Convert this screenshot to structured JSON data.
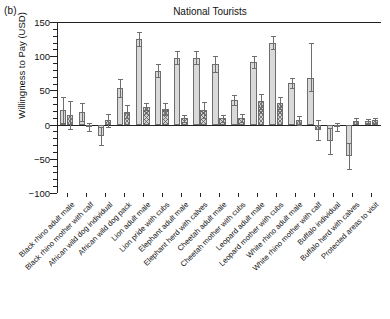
{
  "panel": {
    "label": "(b)"
  },
  "title": "National Tourists",
  "axes": {
    "ylabel": "Willingness to Pay (USD)",
    "ylim": [
      -100,
      150
    ],
    "yticks": [
      150,
      100,
      50,
      0,
      -50,
      -100
    ],
    "yticklabels": [
      "150",
      "100",
      "50",
      "0",
      "−50",
      "−100"
    ],
    "grid": false
  },
  "chart_data": {
    "type": "bar",
    "title": "National Tourists",
    "xlabel": "",
    "ylabel": "Willingness to Pay (USD)",
    "ylim": [
      -100,
      150
    ],
    "yticks": [
      150,
      100,
      50,
      0,
      -50,
      -100
    ],
    "categories": [
      "Black rhino adult male",
      "Black rhino mother with calf",
      "African wild dog individual",
      "African wild dog pack",
      "Lion adult male",
      "Lion pride with cubs",
      "Elephant adult male",
      "Elephant herd with calves",
      "Cheetah adult male",
      "Cheetah mother with cubs",
      "Leopard adult male",
      "Leopard mother with cubs",
      "White rhino adult male",
      "White rhino mother with calf",
      "Buffalo individual",
      "Buffalo herd with calves",
      "Protected areas to visit"
    ],
    "series": [
      {
        "name": "Bar A (light fill)",
        "pattern": "plain",
        "values": [
          21,
          18,
          -17,
          53,
          125,
          79,
          98,
          98,
          89,
          36,
          92,
          120,
          61,
          68,
          -24,
          -46,
          5
        ],
        "err_low": [
          19,
          13,
          13,
          13,
          10,
          10,
          9,
          9,
          12,
          8,
          9,
          10,
          7,
          19,
          19,
          19,
          3
        ],
        "err_high": [
          19,
          13,
          13,
          13,
          10,
          10,
          9,
          9,
          12,
          8,
          9,
          10,
          7,
          52,
          19,
          19,
          3
        ]
      },
      {
        "name": "Bar B (hatched fill)",
        "pattern": "hatch",
        "values": [
          14,
          -3,
          6,
          19,
          26,
          23,
          9,
          21,
          9,
          10,
          34,
          32,
          6,
          -8,
          -4,
          5,
          6
        ],
        "err_low": [
          21,
          6,
          9,
          9,
          5,
          9,
          5,
          12,
          5,
          6,
          11,
          9,
          6,
          15,
          6,
          4,
          3
        ],
        "err_high": [
          21,
          6,
          9,
          9,
          5,
          9,
          5,
          12,
          5,
          6,
          11,
          9,
          6,
          15,
          6,
          4,
          3
        ]
      }
    ],
    "note": "Paired bars per category: a light solid-grey bar and a cross-hatched bar, each with symmetric error bars."
  }
}
